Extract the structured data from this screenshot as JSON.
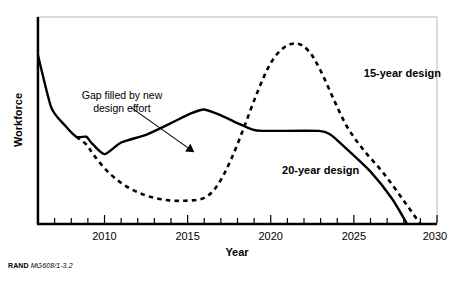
{
  "figure": {
    "credit_brand": "RAND",
    "credit_code": "MG608/1-3.2"
  },
  "chart_data": {
    "type": "line",
    "title": "",
    "xlabel": "Year",
    "ylabel": "Workforce",
    "xlim": [
      2006,
      2030
    ],
    "ylim": [
      0,
      100
    ],
    "grid": false,
    "legend_position": "inline-annotations",
    "x_ticks_major": [
      2010,
      2015,
      2020,
      2025,
      2030
    ],
    "x_tick_labels": [
      "2010",
      "2015",
      "2020",
      "2025",
      "2030"
    ],
    "x_ticks_minor": [
      2007,
      2008,
      2009,
      2011,
      2012,
      2013,
      2014,
      2016,
      2017,
      2018,
      2019,
      2021,
      2022,
      2023,
      2024,
      2026,
      2027,
      2028,
      2029
    ],
    "y_ticks": [],
    "y_tick_labels": [],
    "series": [
      {
        "name": "20-year design",
        "style": "solid",
        "color": "#000000",
        "x": [
          2006.0,
          2006.8,
          2007.6,
          2008.3,
          2008.9,
          2009.2,
          2010.0,
          2011.0,
          2012.5,
          2014.0,
          2015.2,
          2016.0,
          2017.0,
          2018.0,
          2018.8,
          2019.5,
          2022.9,
          2023.6,
          2024.4,
          2026.0,
          2027.3,
          2028.2
        ],
        "y": [
          87.0,
          60.0,
          51.0,
          45.0,
          45.0,
          42.0,
          36.0,
          42.0,
          46.0,
          52.0,
          57.0,
          59.0,
          56.0,
          52.0,
          49.0,
          48.0,
          48.0,
          46.0,
          40.0,
          27.0,
          13.0,
          0.0
        ]
      },
      {
        "name": "15-year design",
        "style": "dashed",
        "color": "#000000",
        "x": [
          2008.3,
          2008.9,
          2009.4,
          2010.2,
          2011.2,
          2012.4,
          2013.6,
          2014.8,
          2016.0,
          2016.8,
          2017.6,
          2018.4,
          2019.2,
          2020.0,
          2020.8,
          2021.6,
          2022.3,
          2023.0,
          2023.8,
          2024.6,
          2025.6,
          2026.8,
          2028.0,
          2029.0
        ],
        "y": [
          45.0,
          41.0,
          35.0,
          27.0,
          20.0,
          15.0,
          12.5,
          12.0,
          13.5,
          20.0,
          33.0,
          50.0,
          68.0,
          83.0,
          91.0,
          93.0,
          89.0,
          79.0,
          64.0,
          50.0,
          38.0,
          26.0,
          12.0,
          0.0
        ]
      }
    ],
    "annotations": [
      {
        "id": "gap-annotation",
        "line1": "Gap filled by new",
        "line2": "design effort",
        "arrow_from": [
          2011.6,
          60.0
        ],
        "arrow_to": [
          2015.4,
          37.0
        ]
      },
      {
        "id": "series-label-15",
        "text": "15-year design",
        "at": [
          2025.6,
          76.0
        ]
      },
      {
        "id": "series-label-20",
        "text": "20-year design",
        "at": [
          2023.0,
          26.0
        ]
      }
    ]
  }
}
